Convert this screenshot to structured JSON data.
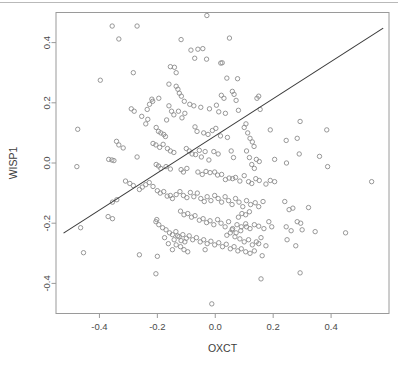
{
  "chart_data": {
    "type": "scatter",
    "title": "",
    "subtitle": "",
    "xlabel": "OXCT",
    "ylabel": "WISP1",
    "xlim": [
      -0.55,
      0.6
    ],
    "ylim": [
      -0.5,
      0.5
    ],
    "xticks": [
      -0.4,
      -0.2,
      0.0,
      0.2,
      0.4
    ],
    "xticklabels": [
      "-0.4",
      "-0.2",
      "0.0",
      "0.2",
      "0.4"
    ],
    "yticks": [
      -0.4,
      -0.2,
      0.0,
      0.2,
      0.4
    ],
    "yticklabels": [
      "-0.4",
      "-0.2",
      "0.0",
      "0.2",
      "0.4"
    ],
    "grid": false,
    "legend": null,
    "marker": "open-circle",
    "marker_color": "#8c8c8c",
    "marker_size": 4.4,
    "frame_color": "#9a9a9a",
    "background": "#ffffff",
    "annotations": [],
    "series": [
      {
        "name": "samples",
        "type": "scatter",
        "points": [
          [
            -0.029,
            0.49
          ],
          [
            -0.356,
            0.455
          ],
          [
            -0.27,
            0.455
          ],
          [
            -0.333,
            0.412
          ],
          [
            -0.118,
            0.41
          ],
          [
            0.049,
            0.415
          ],
          [
            -0.084,
            0.375
          ],
          [
            -0.06,
            0.378
          ],
          [
            -0.043,
            0.38
          ],
          [
            -0.071,
            0.348
          ],
          [
            -0.03,
            0.345
          ],
          [
            0.019,
            0.332
          ],
          [
            0.024,
            0.333
          ],
          [
            -0.155,
            0.32
          ],
          [
            -0.141,
            0.318
          ],
          [
            -0.397,
            0.275
          ],
          [
            0.04,
            0.282
          ],
          [
            0.077,
            0.28
          ],
          [
            -0.16,
            0.262
          ],
          [
            -0.283,
            0.3
          ],
          [
            -0.135,
            0.255
          ],
          [
            -0.129,
            0.245
          ],
          [
            -0.124,
            0.232
          ],
          [
            -0.117,
            0.222
          ],
          [
            -0.135,
            0.3
          ],
          [
            -0.107,
            0.205
          ],
          [
            -0.195,
            0.215
          ],
          [
            -0.219,
            0.212
          ],
          [
            0.021,
            0.225
          ],
          [
            0.03,
            0.215
          ],
          [
            0.059,
            0.238
          ],
          [
            0.065,
            0.228
          ],
          [
            0.072,
            0.208
          ],
          [
            0.15,
            0.222
          ],
          [
            0.144,
            0.215
          ],
          [
            -0.088,
            0.195
          ],
          [
            -0.074,
            0.19
          ],
          [
            -0.05,
            0.185
          ],
          [
            -0.02,
            0.18
          ],
          [
            0.004,
            0.192
          ],
          [
            0.012,
            0.17
          ],
          [
            0.035,
            0.165
          ],
          [
            0.08,
            0.175
          ],
          [
            0.155,
            0.178
          ],
          [
            -0.29,
            0.18
          ],
          [
            -0.28,
            0.172
          ],
          [
            -0.235,
            0.178
          ],
          [
            -0.216,
            0.205
          ],
          [
            -0.227,
            0.195
          ],
          [
            -0.151,
            0.172
          ],
          [
            -0.143,
            0.16
          ],
          [
            -0.16,
            0.19
          ],
          [
            -0.168,
            0.143
          ],
          [
            -0.127,
            0.172
          ],
          [
            -0.115,
            0.15
          ],
          [
            -0.105,
            0.165
          ],
          [
            -0.254,
            0.155
          ],
          [
            -0.233,
            0.145
          ],
          [
            -0.24,
            0.13
          ],
          [
            -0.204,
            0.118
          ],
          [
            -0.196,
            0.105
          ],
          [
            -0.188,
            0.1
          ],
          [
            -0.178,
            0.095
          ],
          [
            -0.172,
            0.088
          ],
          [
            -0.07,
            0.12
          ],
          [
            -0.063,
            0.105
          ],
          [
            -0.04,
            0.1
          ],
          [
            -0.025,
            0.095
          ],
          [
            -0.01,
            0.108
          ],
          [
            0.002,
            0.115
          ],
          [
            0.018,
            0.09
          ],
          [
            0.042,
            0.085
          ],
          [
            0.106,
            0.13
          ],
          [
            0.1,
            0.118
          ],
          [
            0.112,
            0.1
          ],
          [
            0.12,
            0.082
          ],
          [
            0.128,
            0.07
          ],
          [
            0.134,
            0.055
          ],
          [
            0.293,
            0.138
          ],
          [
            0.385,
            0.11
          ],
          [
            0.19,
            0.11
          ],
          [
            0.245,
            0.075
          ],
          [
            0.283,
            0.082
          ],
          [
            -0.475,
            0.112
          ],
          [
            -0.318,
            0.05
          ],
          [
            -0.333,
            0.06
          ],
          [
            -0.341,
            0.072
          ],
          [
            -0.215,
            0.065
          ],
          [
            -0.205,
            0.06
          ],
          [
            -0.192,
            0.052
          ],
          [
            -0.18,
            0.062
          ],
          [
            -0.165,
            0.048
          ],
          [
            -0.155,
            0.04
          ],
          [
            -0.143,
            0.035
          ],
          [
            -0.1,
            0.048
          ],
          [
            -0.09,
            0.04
          ],
          [
            -0.08,
            0.03
          ],
          [
            -0.068,
            0.028
          ],
          [
            -0.055,
            0.042
          ],
          [
            -0.048,
            0.02
          ],
          [
            -0.035,
            0.038
          ],
          [
            -0.022,
            0.01
          ],
          [
            -0.005,
            0.038
          ],
          [
            0.01,
            0.03
          ],
          [
            0.055,
            0.04
          ],
          [
            0.063,
            0.018
          ],
          [
            0.108,
            0.04
          ],
          [
            0.118,
            0.018
          ],
          [
            0.126,
            -0.005
          ],
          [
            0.135,
            -0.018
          ],
          [
            0.142,
            0.012
          ],
          [
            0.152,
            0.005
          ],
          [
            0.205,
            0.012
          ],
          [
            0.246,
            0.0
          ],
          [
            0.29,
            0.03
          ],
          [
            0.36,
            0.022
          ],
          [
            -0.35,
            0.008
          ],
          [
            -0.357,
            0.01
          ],
          [
            -0.368,
            0.012
          ],
          [
            -0.27,
            0.02
          ],
          [
            -0.478,
            -0.012
          ],
          [
            0.388,
            -0.012
          ],
          [
            -0.204,
            -0.005
          ],
          [
            -0.196,
            -0.01
          ],
          [
            -0.188,
            -0.018
          ],
          [
            -0.17,
            -0.012
          ],
          [
            -0.155,
            -0.02
          ],
          [
            -0.118,
            -0.022
          ],
          [
            -0.11,
            -0.03
          ],
          [
            -0.098,
            -0.018
          ],
          [
            -0.06,
            -0.03
          ],
          [
            -0.045,
            -0.038
          ],
          [
            -0.032,
            -0.028
          ],
          [
            -0.018,
            -0.032
          ],
          [
            -0.002,
            -0.03
          ],
          [
            0.008,
            -0.04
          ],
          [
            0.022,
            -0.038
          ],
          [
            0.035,
            -0.055
          ],
          [
            0.048,
            -0.05
          ],
          [
            0.06,
            -0.052
          ],
          [
            0.07,
            -0.048
          ],
          [
            0.085,
            -0.06
          ],
          [
            0.1,
            -0.042
          ],
          [
            0.115,
            -0.062
          ],
          [
            0.126,
            -0.068
          ],
          [
            0.14,
            -0.052
          ],
          [
            0.152,
            -0.058
          ],
          [
            0.175,
            -0.07
          ],
          [
            0.19,
            -0.058
          ],
          [
            0.205,
            -0.062
          ],
          [
            0.54,
            -0.062
          ],
          [
            -0.31,
            -0.06
          ],
          [
            -0.295,
            -0.068
          ],
          [
            -0.283,
            -0.075
          ],
          [
            -0.262,
            -0.088
          ],
          [
            -0.252,
            -0.08
          ],
          [
            -0.24,
            -0.072
          ],
          [
            -0.228,
            -0.065
          ],
          [
            -0.215,
            -0.078
          ],
          [
            -0.2,
            -0.092
          ],
          [
            -0.19,
            -0.1
          ],
          [
            -0.178,
            -0.095
          ],
          [
            -0.166,
            -0.11
          ],
          [
            -0.155,
            -0.108
          ],
          [
            -0.148,
            -0.118
          ],
          [
            -0.135,
            -0.105
          ],
          [
            -0.122,
            -0.095
          ],
          [
            -0.11,
            -0.108
          ],
          [
            -0.098,
            -0.115
          ],
          [
            -0.086,
            -0.098
          ],
          [
            -0.074,
            -0.112
          ],
          [
            -0.062,
            -0.1
          ],
          [
            -0.05,
            -0.118
          ],
          [
            -0.038,
            -0.128
          ],
          [
            -0.028,
            -0.112
          ],
          [
            -0.015,
            -0.125
          ],
          [
            -0.002,
            -0.108
          ],
          [
            0.01,
            -0.118
          ],
          [
            0.022,
            -0.13
          ],
          [
            0.034,
            -0.112
          ],
          [
            0.046,
            -0.125
          ],
          [
            0.058,
            -0.138
          ],
          [
            0.07,
            -0.118
          ],
          [
            0.082,
            -0.13
          ],
          [
            0.095,
            -0.145
          ],
          [
            0.108,
            -0.125
          ],
          [
            0.122,
            -0.138
          ],
          [
            0.138,
            -0.132
          ],
          [
            0.15,
            -0.145
          ],
          [
            0.165,
            -0.128
          ],
          [
            0.24,
            -0.128
          ],
          [
            0.255,
            -0.155
          ],
          [
            0.268,
            -0.15
          ],
          [
            0.283,
            -0.195
          ],
          [
            0.295,
            -0.2
          ],
          [
            0.322,
            -0.148
          ],
          [
            -0.34,
            -0.122
          ],
          [
            -0.355,
            -0.13
          ],
          [
            -0.37,
            -0.178
          ],
          [
            -0.355,
            -0.185
          ],
          [
            -0.12,
            -0.16
          ],
          [
            -0.108,
            -0.172
          ],
          [
            -0.095,
            -0.168
          ],
          [
            -0.082,
            -0.18
          ],
          [
            -0.07,
            -0.175
          ],
          [
            -0.055,
            -0.19
          ],
          [
            -0.042,
            -0.185
          ],
          [
            -0.03,
            -0.198
          ],
          [
            -0.018,
            -0.192
          ],
          [
            -0.005,
            -0.205
          ],
          [
            0.008,
            -0.188
          ],
          [
            0.02,
            -0.2
          ],
          [
            0.034,
            -0.212
          ],
          [
            0.046,
            -0.195
          ],
          [
            0.06,
            -0.218
          ],
          [
            0.075,
            -0.205
          ],
          [
            0.09,
            -0.212
          ],
          [
            0.105,
            -0.202
          ],
          [
            0.12,
            -0.218
          ],
          [
            0.135,
            -0.205
          ],
          [
            0.15,
            -0.21
          ],
          [
            0.168,
            -0.218
          ],
          [
            0.195,
            -0.212
          ],
          [
            0.185,
            -0.195
          ],
          [
            -0.205,
            -0.195
          ],
          [
            -0.195,
            -0.205
          ],
          [
            -0.182,
            -0.215
          ],
          [
            -0.17,
            -0.222
          ],
          [
            -0.158,
            -0.232
          ],
          [
            -0.148,
            -0.238
          ],
          [
            -0.136,
            -0.228
          ],
          [
            -0.125,
            -0.245
          ],
          [
            -0.112,
            -0.238
          ],
          [
            -0.1,
            -0.25
          ],
          [
            -0.09,
            -0.242
          ],
          [
            -0.078,
            -0.255
          ],
          [
            -0.065,
            -0.248
          ],
          [
            -0.052,
            -0.262
          ],
          [
            -0.04,
            -0.255
          ],
          [
            -0.028,
            -0.268
          ],
          [
            -0.015,
            -0.26
          ],
          [
            -0.002,
            -0.272
          ],
          [
            0.012,
            -0.265
          ],
          [
            0.025,
            -0.278
          ],
          [
            0.038,
            -0.27
          ],
          [
            0.052,
            -0.285
          ],
          [
            0.065,
            -0.278
          ],
          [
            0.078,
            -0.292
          ],
          [
            0.09,
            -0.285
          ],
          [
            0.105,
            -0.295
          ],
          [
            0.12,
            -0.3
          ],
          [
            0.135,
            -0.292
          ],
          [
            -0.465,
            -0.215
          ],
          [
            -0.455,
            -0.298
          ],
          [
            -0.262,
            -0.305
          ],
          [
            -0.202,
            -0.188
          ],
          [
            -0.2,
            -0.31
          ],
          [
            0.245,
            -0.212
          ],
          [
            0.262,
            -0.225
          ],
          [
            0.3,
            -0.222
          ],
          [
            0.345,
            -0.228
          ],
          [
            0.45,
            -0.232
          ],
          [
            0.248,
            -0.255
          ],
          [
            0.278,
            -0.275
          ],
          [
            0.15,
            -0.268
          ],
          [
            0.175,
            -0.275
          ],
          [
            0.162,
            -0.308
          ],
          [
            -0.035,
            -0.288
          ],
          [
            -0.205,
            -0.368
          ],
          [
            0.158,
            -0.385
          ],
          [
            0.293,
            -0.365
          ],
          [
            -0.012,
            -0.468
          ],
          [
            -0.13,
            -0.242
          ],
          [
            -0.142,
            -0.255
          ],
          [
            -0.118,
            -0.258
          ],
          [
            -0.105,
            -0.262
          ],
          [
            -0.135,
            -0.272
          ],
          [
            -0.12,
            -0.278
          ],
          [
            -0.108,
            -0.288
          ],
          [
            -0.095,
            -0.295
          ],
          [
            -0.148,
            -0.288
          ],
          [
            -0.162,
            -0.268
          ],
          [
            -0.175,
            -0.248
          ],
          [
            0.04,
            -0.24
          ],
          [
            0.052,
            -0.232
          ],
          [
            0.068,
            -0.245
          ],
          [
            0.085,
            -0.252
          ],
          [
            0.1,
            -0.262
          ],
          [
            0.115,
            -0.255
          ],
          [
            0.128,
            -0.272
          ],
          [
            0.142,
            -0.262
          ],
          [
            0.158,
            -0.248
          ],
          [
            0.108,
            -0.212
          ],
          [
            0.088,
            -0.225
          ],
          [
            0.072,
            -0.232
          ],
          [
            0.058,
            -0.222
          ],
          [
            0.118,
            -0.162
          ],
          [
            0.105,
            -0.172
          ],
          [
            0.092,
            -0.168
          ],
          [
            0.08,
            -0.18
          ]
        ]
      }
    ],
    "fit_line": {
      "name": "regression-line",
      "type": "line",
      "color": "#3a3a3a",
      "x_start": -0.524,
      "y_start": -0.233,
      "x_end": 0.58,
      "y_end": 0.448,
      "slope": 0.617,
      "intercept": 0.09
    }
  }
}
